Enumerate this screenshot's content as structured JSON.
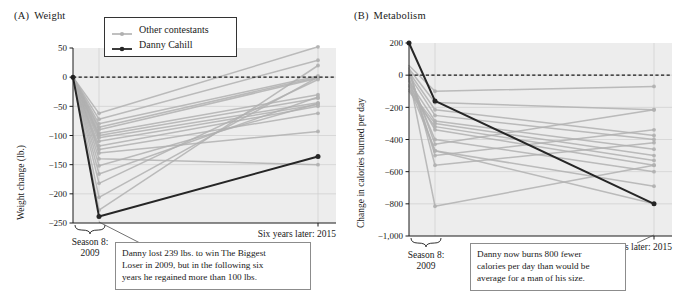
{
  "figure": {
    "background": "#ffffff",
    "plot_background": "#ededed",
    "other_color": "#b0b0b0",
    "danny_color": "#262626",
    "grid_color": "#cfcfcf"
  },
  "legend": {
    "items": [
      {
        "label": "Other contestants",
        "color": "#b0b0b0",
        "marker": "line-with-dot"
      },
      {
        "label": "Danny Cahill",
        "color": "#262626",
        "marker": "line-with-dot"
      }
    ]
  },
  "panels": [
    {
      "id": "A",
      "tag": "(A)",
      "title": "Weight",
      "ylabel": "Weight change (lb.)",
      "x_left_label_line1": "Season 8:",
      "x_left_label_line2": "2009",
      "x_right_label": "Six years later: 2015",
      "callout": "Danny lost 239 lbs. to win The Biggest\nLoser in 2009, but in the following six\nyears he regained more than 100 lbs."
    },
    {
      "id": "B",
      "tag": "(B)",
      "title": "Metabolism",
      "ylabel": "Change in calories burned per day",
      "x_left_label_line1": "Season 8:",
      "x_left_label_line2": "2009",
      "x_right_label": "Six years later: 2015",
      "callout": "Danny now burns 800 fewer\ncalories per day than would be\naverage for a man of his size."
    }
  ],
  "chart_data": [
    {
      "type": "line",
      "title": "Weight",
      "panel": "(A)",
      "xlabel": "",
      "ylabel": "Weight change (lb.)",
      "x": [
        "Baseline",
        "Season 8: 2009",
        "Six years later: 2015"
      ],
      "ylim": [
        -250,
        50
      ],
      "yticks": [
        50,
        0,
        -50,
        -100,
        -150,
        -200,
        -250
      ],
      "ytick_labels": [
        "50",
        "0",
        "-50",
        "-100",
        "-150",
        "-200",
        "-250"
      ],
      "grid": true,
      "legend_position": "top-center",
      "zero_reference_line": 0,
      "series": [
        {
          "name": "Danny Cahill",
          "color": "#262626",
          "highlight": true,
          "values": [
            0,
            -239,
            -136
          ]
        },
        {
          "name": "Contestant 1",
          "color": "#b0b0b0",
          "values": [
            0,
            -62,
            52
          ]
        },
        {
          "name": "Contestant 2",
          "color": "#b0b0b0",
          "values": [
            0,
            -72,
            29
          ]
        },
        {
          "name": "Contestant 3",
          "color": "#b0b0b0",
          "values": [
            0,
            -80,
            2
          ]
        },
        {
          "name": "Contestant 4",
          "color": "#b0b0b0",
          "values": [
            0,
            -86,
            0
          ]
        },
        {
          "name": "Contestant 5",
          "color": "#b0b0b0",
          "values": [
            0,
            -90,
            -2
          ]
        },
        {
          "name": "Contestant 6",
          "color": "#b0b0b0",
          "values": [
            0,
            -96,
            -30
          ]
        },
        {
          "name": "Contestant 7",
          "color": "#b0b0b0",
          "values": [
            0,
            -100,
            -36
          ]
        },
        {
          "name": "Contestant 8",
          "color": "#b0b0b0",
          "values": [
            0,
            -104,
            -44
          ]
        },
        {
          "name": "Contestant 9",
          "color": "#b0b0b0",
          "values": [
            0,
            -110,
            -47
          ]
        },
        {
          "name": "Contestant 10",
          "color": "#b0b0b0",
          "values": [
            0,
            -118,
            -50
          ]
        },
        {
          "name": "Contestant 11",
          "color": "#b0b0b0",
          "values": [
            0,
            -124,
            -62
          ]
        },
        {
          "name": "Contestant 12",
          "color": "#b0b0b0",
          "values": [
            0,
            -130,
            -93
          ]
        },
        {
          "name": "Contestant 13",
          "color": "#b0b0b0",
          "values": [
            0,
            -140,
            -150
          ]
        },
        {
          "name": "Contestant 14",
          "color": "#b0b0b0",
          "values": [
            0,
            -152,
            -45
          ]
        },
        {
          "name": "Contestant 15",
          "color": "#b0b0b0",
          "values": [
            0,
            -166,
            -34
          ]
        },
        {
          "name": "Contestant 16",
          "color": "#b0b0b0",
          "values": [
            0,
            -182,
            -4
          ]
        },
        {
          "name": "Contestant 17",
          "color": "#b0b0b0",
          "values": [
            0,
            -206,
            0
          ]
        },
        {
          "name": "Contestant 18",
          "color": "#b0b0b0",
          "values": [
            0,
            -228,
            20
          ]
        }
      ]
    },
    {
      "type": "line",
      "title": "Metabolism",
      "panel": "(B)",
      "xlabel": "",
      "ylabel": "Change in calories burned per day",
      "x": [
        "Baseline",
        "Season 8: 2009",
        "Six years later: 2015"
      ],
      "ylim": [
        -1000,
        200
      ],
      "yticks": [
        200,
        0,
        -200,
        -400,
        -600,
        -800,
        -1000
      ],
      "ytick_labels": [
        "200",
        "0",
        "-200",
        "-400",
        "-600",
        "-800",
        "-1,000"
      ],
      "grid": true,
      "legend_position": "none",
      "zero_reference_line": 0,
      "series": [
        {
          "name": "Danny Cahill",
          "color": "#262626",
          "highlight": true,
          "values": [
            200,
            -160,
            -800
          ]
        },
        {
          "name": "Contestant 1",
          "color": "#b0b0b0",
          "values": [
            60,
            -100,
            -70
          ]
        },
        {
          "name": "Contestant 2",
          "color": "#b0b0b0",
          "values": [
            40,
            -170,
            -215
          ]
        },
        {
          "name": "Contestant 3",
          "color": "#b0b0b0",
          "values": [
            20,
            -215,
            -375
          ]
        },
        {
          "name": "Contestant 4",
          "color": "#b0b0b0",
          "values": [
            0,
            -250,
            -400
          ]
        },
        {
          "name": "Contestant 5",
          "color": "#b0b0b0",
          "values": [
            -40,
            -285,
            -460
          ]
        },
        {
          "name": "Contestant 6",
          "color": "#b0b0b0",
          "values": [
            -90,
            -300,
            -500
          ]
        },
        {
          "name": "Contestant 7",
          "color": "#b0b0b0",
          "values": [
            -100,
            -320,
            -530
          ]
        },
        {
          "name": "Contestant 8",
          "color": "#b0b0b0",
          "values": [
            -60,
            -340,
            -560
          ]
        },
        {
          "name": "Contestant 9",
          "color": "#b0b0b0",
          "values": [
            -20,
            -400,
            -600
          ]
        },
        {
          "name": "Contestant 10",
          "color": "#b0b0b0",
          "values": [
            10,
            -430,
            -215
          ]
        },
        {
          "name": "Contestant 11",
          "color": "#b0b0b0",
          "values": [
            -30,
            -470,
            -690
          ]
        },
        {
          "name": "Contestant 12",
          "color": "#b0b0b0",
          "values": [
            30,
            -500,
            -340
          ]
        },
        {
          "name": "Contestant 13",
          "color": "#b0b0b0",
          "values": [
            50,
            -560,
            -420
          ]
        },
        {
          "name": "Contestant 14",
          "color": "#b0b0b0",
          "values": [
            -10,
            -815,
            -560
          ]
        },
        {
          "name": "Contestant 15",
          "color": "#b0b0b0",
          "values": [
            -70,
            -470,
            -800
          ]
        }
      ]
    }
  ]
}
